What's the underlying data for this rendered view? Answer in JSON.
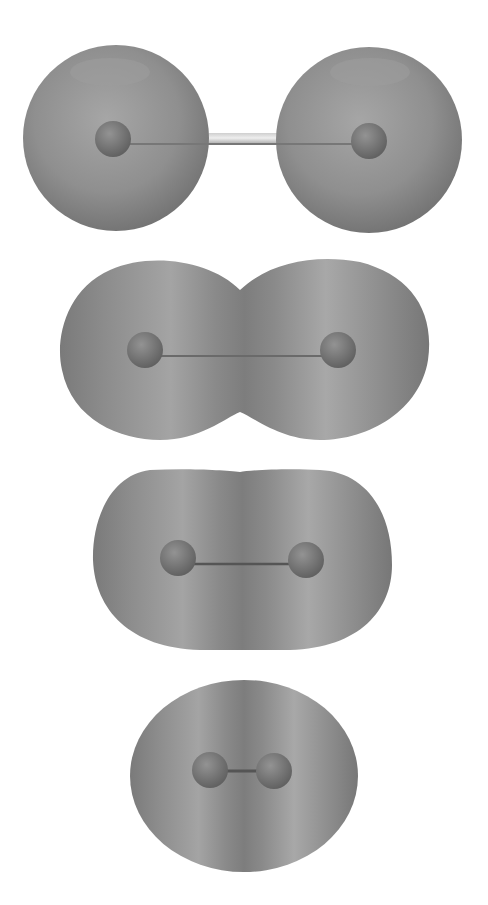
{
  "figure": {
    "background_color": "#ffffff",
    "surface_color": "#8a8a8a",
    "nucleus_color": "#6e6e6e",
    "bond_color": "#9a9a9a",
    "panels": [
      {
        "id": "separated",
        "description": "Two separate spherical densities joined by a bond rod",
        "nuclei_x": [
          118,
          368
        ],
        "center_y": 138
      },
      {
        "id": "touching",
        "description": "Overlapping densities forming a peanut shape",
        "nuclei_x": [
          148,
          338
        ],
        "center_y": 350
      },
      {
        "id": "merged",
        "description": "Merged oblong density",
        "nuclei_x": [
          178,
          305
        ],
        "center_y": 560
      },
      {
        "id": "compact",
        "description": "Compact ovoid density at equilibrium-like distance",
        "nuclei_x": [
          210,
          273
        ],
        "center_y": 770
      }
    ]
  }
}
